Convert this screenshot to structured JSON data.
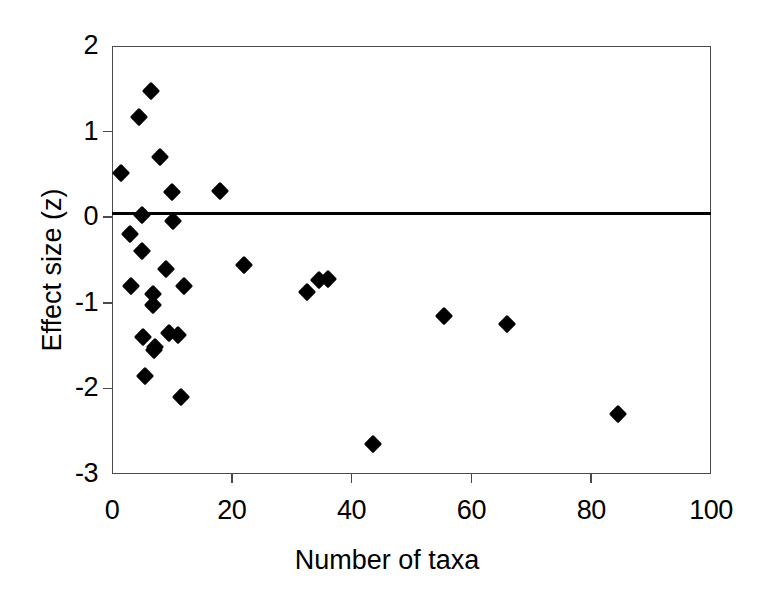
{
  "chart_data": {
    "type": "scatter",
    "title": "",
    "xlabel": "Number of taxa",
    "ylabel": "Effect size (z)",
    "xlim": [
      0,
      100
    ],
    "ylim": [
      -3,
      2
    ],
    "xticks": [
      0,
      20,
      40,
      60,
      80,
      100
    ],
    "yticks": [
      2,
      1,
      0,
      -1,
      -2,
      -3
    ],
    "xtick_labels": [
      "0",
      "20",
      "40",
      "60",
      "80",
      "100"
    ],
    "ytick_labels": [
      "2",
      "1",
      "0",
      "-1",
      "-2",
      "-3"
    ],
    "grid": false,
    "legend": null,
    "marker": "filled-diamond",
    "marker_color": "#000000",
    "reference_line": {
      "orientation": "horizontal",
      "y": 0,
      "color": "#000000",
      "width_px": 3
    },
    "series": [
      {
        "name": "studies",
        "n_points": 31,
        "points": [
          {
            "x": 1.5,
            "y": 0.52
          },
          {
            "x": 3.0,
            "y": -0.2
          },
          {
            "x": 3.2,
            "y": -0.8
          },
          {
            "x": 4.5,
            "y": 1.17
          },
          {
            "x": 5.0,
            "y": 0.02
          },
          {
            "x": 5.0,
            "y": -0.4
          },
          {
            "x": 5.2,
            "y": -1.4
          },
          {
            "x": 5.5,
            "y": -1.85
          },
          {
            "x": 6.5,
            "y": 1.48
          },
          {
            "x": 6.8,
            "y": -0.9
          },
          {
            "x": 6.9,
            "y": -1.02
          },
          {
            "x": 7.0,
            "y": -1.55
          },
          {
            "x": 7.2,
            "y": -1.52
          },
          {
            "x": 8.0,
            "y": 0.7
          },
          {
            "x": 9.0,
            "y": -0.6
          },
          {
            "x": 9.5,
            "y": -1.35
          },
          {
            "x": 10.0,
            "y": 0.3
          },
          {
            "x": 10.2,
            "y": -0.04
          },
          {
            "x": 11.0,
            "y": -1.38
          },
          {
            "x": 11.5,
            "y": -2.1
          },
          {
            "x": 12.0,
            "y": -0.8
          },
          {
            "x": 18.0,
            "y": 0.31
          },
          {
            "x": 22.0,
            "y": -0.56
          },
          {
            "x": 32.5,
            "y": -0.87
          },
          {
            "x": 34.5,
            "y": -0.73
          },
          {
            "x": 36.0,
            "y": -0.72
          },
          {
            "x": 43.5,
            "y": -2.65
          },
          {
            "x": 55.5,
            "y": -1.15
          },
          {
            "x": 66.0,
            "y": -1.25
          },
          {
            "x": 84.5,
            "y": -2.3
          }
        ]
      }
    ]
  },
  "figure": {
    "background_color": "#ffffff",
    "frame_color": "#4a4a4a"
  }
}
